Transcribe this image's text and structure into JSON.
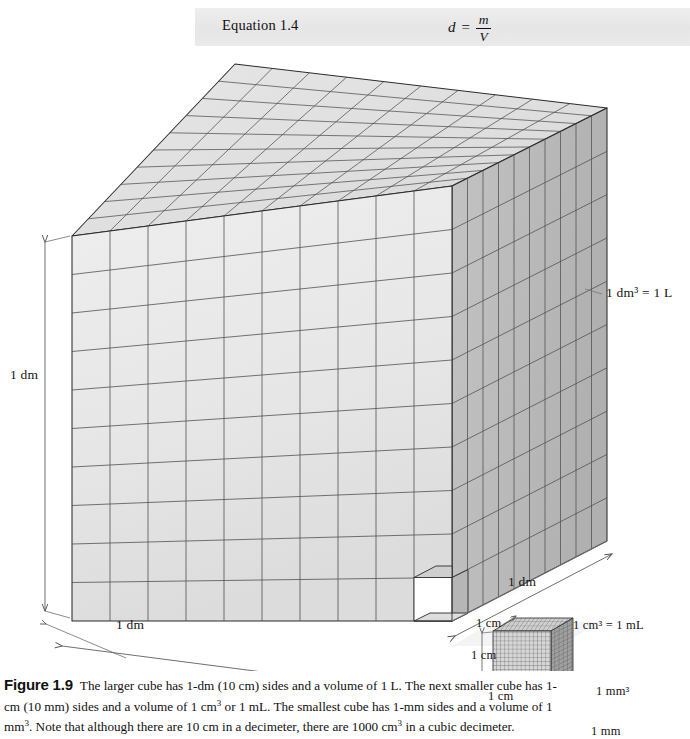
{
  "equation_box": {
    "label": "Equation 1.4",
    "formula": {
      "lhs": "d",
      "relation": "=",
      "numerator": "m",
      "denominator": "V"
    }
  },
  "figure": {
    "labels": {
      "dm_left": "1 dm",
      "dm_bottom": "1 dm",
      "dm_right": "1 dm",
      "dm_volume": "1 dm³ = 1 L",
      "cm_top": "1 cm",
      "cm_left": "1 cm",
      "cm_bottom": "1 cm",
      "cm_volume": "1 cm³ = 1 mL",
      "mm_volume": "1 mm³",
      "mm_size": "1 mm"
    },
    "large_cube": {
      "divisions_per_edge": 10,
      "edge_length": "1 dm",
      "volume": "1 L"
    },
    "medium_cube": {
      "divisions_per_edge": 10,
      "edge_length": "1 cm",
      "volume": "1 mL"
    },
    "small_cube": {
      "edge_length": "1 mm",
      "volume": "1 mm³"
    },
    "colors": {
      "front_face": "#e8e8e8",
      "top_face": "#e2e2e2",
      "right_face": "#b9b9b9",
      "grid_line": "#4a4a4a",
      "outline": "#2b2b2b",
      "dimension_line": "#555555",
      "band_background": "#e9e9e9"
    }
  },
  "caption": {
    "figure_number": "Figure 1.9",
    "text_part_1": "The larger cube has 1-dm (10 cm) sides and a volume of 1 L. The next smaller cube has 1-cm (10 mm) sides and a volume of 1 cm",
    "sup_1": "3",
    "text_part_2": " or 1 mL. The smallest cube has 1-mm sides and a volume of 1 mm",
    "sup_2": "3",
    "text_part_3": ". Note that although there are 10 cm in a decimeter, there are 1000 cm",
    "sup_3": "3",
    "text_part_4": " in a cubic decimeter."
  }
}
